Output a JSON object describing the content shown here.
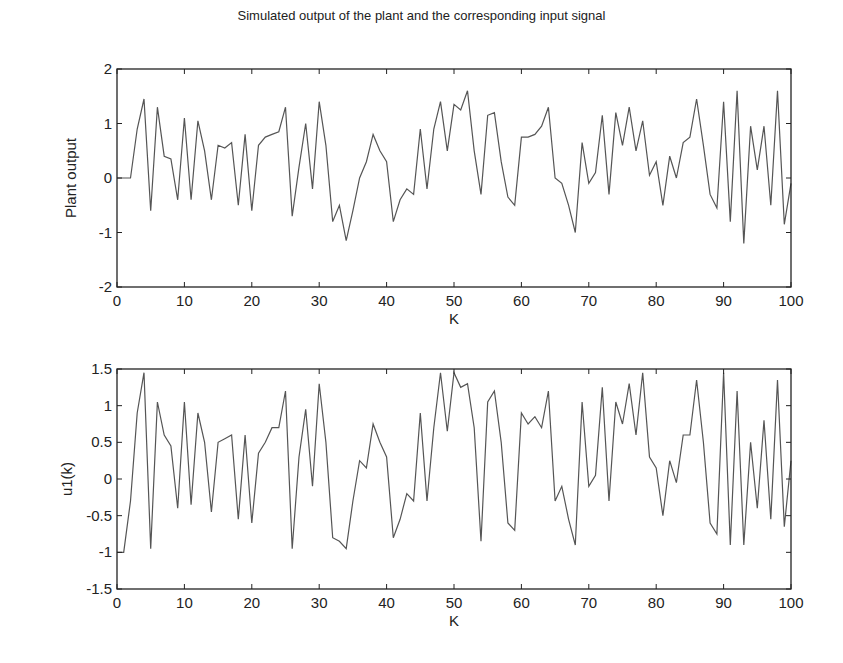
{
  "chart_data": [
    {
      "type": "line",
      "title": "Simulated output of the plant and the corresponding input signal",
      "xlabel": "K",
      "ylabel": "Plant output",
      "xlim": [
        0,
        100
      ],
      "ylim": [
        -2,
        2
      ],
      "xticks": [
        0,
        10,
        20,
        30,
        40,
        50,
        60,
        70,
        80,
        90,
        100
      ],
      "yticks": [
        -2,
        -1,
        0,
        1,
        2
      ],
      "ytick_labels": [
        "-2",
        "-1",
        "0",
        "1",
        "2"
      ],
      "grid": false,
      "line_color": "#555555",
      "x": [
        0,
        1,
        2,
        3,
        4,
        5,
        6,
        7,
        8,
        9,
        10,
        11,
        12,
        13,
        14,
        15,
        16,
        17,
        18,
        19,
        20,
        21,
        22,
        23,
        24,
        25,
        26,
        27,
        28,
        29,
        30,
        31,
        32,
        33,
        34,
        35,
        36,
        37,
        38,
        39,
        40,
        41,
        42,
        43,
        44,
        45,
        46,
        47,
        48,
        49,
        50,
        51,
        52,
        53,
        54,
        55,
        56,
        57,
        58,
        59,
        60,
        61,
        62,
        63,
        64,
        65,
        66,
        67,
        68,
        69,
        70,
        71,
        72,
        73,
        74,
        75,
        76,
        77,
        78,
        79,
        80,
        81,
        82,
        83,
        84,
        85,
        86,
        87,
        88,
        89,
        90,
        91,
        92,
        93,
        94,
        95,
        96,
        97,
        98,
        99,
        100
      ],
      "values": [
        0,
        0,
        0,
        0.9,
        1.45,
        -0.6,
        1.3,
        0.4,
        0.35,
        -0.4,
        1.1,
        -0.4,
        1.05,
        0.5,
        -0.4,
        0.6,
        0.55,
        0.65,
        -0.5,
        0.8,
        -0.6,
        0.6,
        0.75,
        0.8,
        0.85,
        1.3,
        -0.7,
        0.2,
        1.0,
        -0.2,
        1.4,
        0.6,
        -0.8,
        -0.5,
        -1.15,
        -0.6,
        0.0,
        0.3,
        0.8,
        0.5,
        0.3,
        -0.8,
        -0.4,
        -0.2,
        -0.3,
        0.9,
        -0.2,
        0.9,
        1.4,
        0.5,
        1.35,
        1.25,
        1.6,
        0.5,
        -0.3,
        1.15,
        1.2,
        0.3,
        -0.35,
        -0.5,
        0.75,
        0.75,
        0.8,
        0.95,
        1.3,
        0.0,
        -0.1,
        -0.5,
        -1.0,
        0.65,
        -0.1,
        0.1,
        1.15,
        -0.3,
        1.2,
        0.6,
        1.3,
        0.5,
        1.05,
        0.05,
        0.3,
        -0.5,
        0.4,
        0.0,
        0.65,
        0.75,
        1.45,
        0.6,
        -0.3,
        -0.55,
        1.4,
        -0.8,
        1.6,
        -1.2,
        0.95,
        0.15,
        0.95,
        -0.5,
        1.6,
        -0.85,
        -0.1
      ]
    },
    {
      "type": "line",
      "title": "",
      "xlabel": "K",
      "ylabel": "u1(k)",
      "xlim": [
        0,
        100
      ],
      "ylim": [
        -1.5,
        1.5
      ],
      "xticks": [
        0,
        10,
        20,
        30,
        40,
        50,
        60,
        70,
        80,
        90,
        100
      ],
      "yticks": [
        -1.5,
        -1,
        -0.5,
        0,
        0.5,
        1,
        1.5
      ],
      "ytick_labels": [
        "-1.5",
        "-1",
        "-0.5",
        "0",
        "0.5",
        "1",
        "1.5"
      ],
      "grid": false,
      "line_color": "#555555",
      "x": [
        0,
        1,
        2,
        3,
        4,
        5,
        6,
        7,
        8,
        9,
        10,
        11,
        12,
        13,
        14,
        15,
        16,
        17,
        18,
        19,
        20,
        21,
        22,
        23,
        24,
        25,
        26,
        27,
        28,
        29,
        30,
        31,
        32,
        33,
        34,
        35,
        36,
        37,
        38,
        39,
        40,
        41,
        42,
        43,
        44,
        45,
        46,
        47,
        48,
        49,
        50,
        51,
        52,
        53,
        54,
        55,
        56,
        57,
        58,
        59,
        60,
        61,
        62,
        63,
        64,
        65,
        66,
        67,
        68,
        69,
        70,
        71,
        72,
        73,
        74,
        75,
        76,
        77,
        78,
        79,
        80,
        81,
        82,
        83,
        84,
        85,
        86,
        87,
        88,
        89,
        90,
        91,
        92,
        93,
        94,
        95,
        96,
        97,
        98,
        99,
        100
      ],
      "values": [
        -1.0,
        -1.0,
        -0.3,
        0.9,
        1.45,
        -0.95,
        1.05,
        0.6,
        0.45,
        -0.4,
        1.05,
        -0.35,
        0.9,
        0.5,
        -0.45,
        0.5,
        0.55,
        0.6,
        -0.55,
        0.6,
        -0.6,
        0.35,
        0.5,
        0.7,
        0.7,
        1.2,
        -0.95,
        0.3,
        0.95,
        -0.1,
        1.3,
        0.5,
        -0.8,
        -0.85,
        -0.95,
        -0.3,
        0.25,
        0.15,
        0.75,
        0.5,
        0.3,
        -0.8,
        -0.55,
        -0.2,
        -0.3,
        0.9,
        -0.3,
        0.7,
        1.45,
        0.65,
        1.45,
        1.25,
        1.3,
        0.7,
        -0.85,
        1.05,
        1.2,
        0.5,
        -0.6,
        -0.7,
        0.9,
        0.75,
        0.85,
        0.7,
        1.2,
        -0.3,
        -0.1,
        -0.55,
        -0.9,
        1.05,
        -0.1,
        0.05,
        1.25,
        -0.3,
        1.05,
        0.75,
        1.3,
        0.6,
        1.45,
        0.3,
        0.15,
        -0.5,
        0.25,
        -0.05,
        0.6,
        0.6,
        1.35,
        0.5,
        -0.6,
        -0.75,
        1.45,
        -0.9,
        1.2,
        -0.9,
        0.5,
        -0.4,
        0.8,
        -0.55,
        1.35,
        -0.65,
        0.25
      ]
    }
  ],
  "figure": {
    "title": "Simulated output of the plant and the corresponding input signal"
  }
}
